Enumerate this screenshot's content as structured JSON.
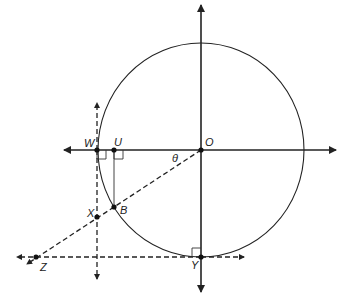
{
  "diagram": {
    "type": "geometry",
    "colors": {
      "stroke": "#222222",
      "background": "#ffffff"
    },
    "labels": {
      "W": "W",
      "U": "U",
      "O": "O",
      "theta": "θ",
      "X": "X",
      "B": "B",
      "Y": "Y",
      "Z": "Z"
    },
    "points": {
      "O": [
        201,
        150
      ],
      "W": [
        97,
        150
      ],
      "U": [
        114,
        150
      ],
      "B": [
        114,
        207
      ],
      "X": [
        97,
        217
      ],
      "Y": [
        201,
        257
      ],
      "Z": [
        36,
        257
      ]
    },
    "right_angle_marks": [
      "W",
      "U",
      "Y"
    ]
  }
}
